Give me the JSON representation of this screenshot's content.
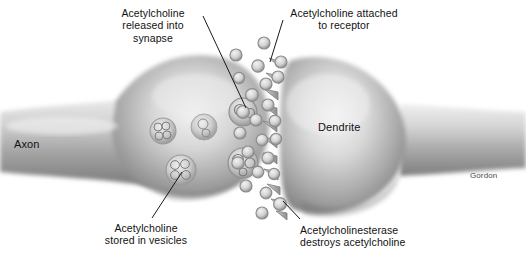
{
  "figure": {
    "style": "grayscale airbrush biology illustration",
    "background_color": "#ffffff",
    "ink_color": "#111111",
    "signature": "Gordon"
  },
  "labels": {
    "released": "Acetylcholine\nreleased into\nsynapse",
    "attached": "Acetylcholine attached\nto receptor",
    "stored": "Acetylcholine\nstored in vesicles",
    "esterase": "Acetylcholinesterase\ndestroys acetylcholine",
    "axon": "Axon",
    "dendrite": "Dendrite",
    "signature": "Gordon"
  },
  "structures": [
    {
      "name": "axon-terminal",
      "side": "left",
      "description": "bulbous presynaptic terminal narrowing to axon shaft"
    },
    {
      "name": "dendrite",
      "side": "right",
      "description": "bulbous postsynaptic dendrite narrowing to the right"
    },
    {
      "name": "synaptic-cleft",
      "side": "center",
      "description": "gap between terminal and dendrite containing neurotransmitter"
    },
    {
      "name": "synaptic-vesicles",
      "count": 4,
      "description": "vesicles inside terminal holding clusters of acetylcholine"
    },
    {
      "name": "acetylcholine-molecules",
      "count": 24,
      "description": "small ring-shaped molecules in cleft"
    },
    {
      "name": "receptors",
      "count": 11,
      "description": "spike-shaped receptor sites on dendrite membrane"
    }
  ],
  "colors": {
    "cell_light": "#f2f2f2",
    "cell_mid": "#b9b9b9",
    "cell_dark": "#8a8a8a",
    "cell_shadow": "#6f6f6f",
    "molecule_fill": "#cfcfcf",
    "molecule_stroke": "#8f8f8f",
    "leader_line": "#1a1a1a"
  }
}
